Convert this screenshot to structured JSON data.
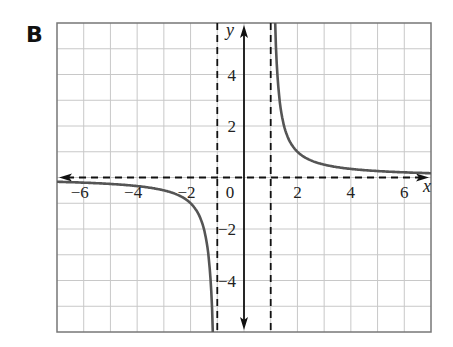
{
  "panel": {
    "label": "B"
  },
  "chart_data": {
    "type": "line",
    "title": "",
    "xlabel": "x",
    "ylabel": "y",
    "xlim": [
      -7,
      7
    ],
    "ylim": [
      -6,
      6
    ],
    "grid": true,
    "x_ticks": [
      -6,
      -4,
      -2,
      0,
      2,
      4,
      6
    ],
    "x_tick_labels": [
      "−6",
      "−4",
      "−2",
      "0",
      "2",
      "4",
      "6"
    ],
    "y_ticks": [
      4,
      2,
      -2,
      -4
    ],
    "y_tick_labels": [
      "4",
      "2",
      "−2",
      "−4"
    ],
    "asymptotes": {
      "vertical": [
        -1,
        1
      ],
      "horizontal": [
        0
      ]
    },
    "series": [
      {
        "name": "left branch (x < -1)",
        "points": [
          [
            -7,
            -0.17
          ],
          [
            -6,
            -0.2
          ],
          [
            -5,
            -0.25
          ],
          [
            -4,
            -0.33
          ],
          [
            -3,
            -0.5
          ],
          [
            -2.5,
            -0.67
          ],
          [
            -2,
            -1.0
          ],
          [
            -1.5,
            -2.0
          ],
          [
            -1.25,
            -4.0
          ],
          [
            -1.17,
            -6.0
          ]
        ]
      },
      {
        "name": "right branch (x > 1)",
        "points": [
          [
            1.17,
            6.0
          ],
          [
            1.25,
            4.0
          ],
          [
            1.5,
            2.0
          ],
          [
            2,
            1.0
          ],
          [
            2.5,
            0.67
          ],
          [
            3,
            0.5
          ],
          [
            4,
            0.33
          ],
          [
            5,
            0.25
          ],
          [
            6,
            0.2
          ],
          [
            7,
            0.17
          ]
        ]
      }
    ],
    "colors": {
      "curve": "#555555",
      "axis": "#111111",
      "grid": "#c8c8c8",
      "border": "#777777",
      "asymptote": "#111111"
    }
  }
}
